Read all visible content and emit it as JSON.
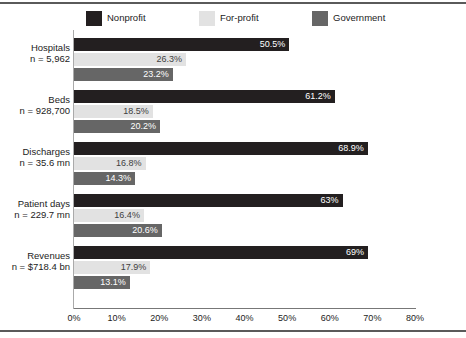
{
  "legend": {
    "items": [
      {
        "label": "Nonprofit",
        "color": "#231f20",
        "left": 0
      },
      {
        "label": "For-profit",
        "color": "#e2e2e2",
        "left": 113
      },
      {
        "label": "Government",
        "color": "#666666",
        "left": 226
      }
    ]
  },
  "axis": {
    "ticks": [
      "0%",
      "10%",
      "20%",
      "30%",
      "40%",
      "50%",
      "60%",
      "70%",
      "80%"
    ]
  },
  "categories": [
    {
      "name": "Hospitals",
      "n": "n = 5,962"
    },
    {
      "name": "Beds",
      "n": "n = 928,700"
    },
    {
      "name": "Discharges",
      "n": "n = 35.6 mn"
    },
    {
      "name": "Patient days",
      "n": "n = 229.7 mn"
    },
    {
      "name": "Revenues",
      "n": "n = $718.4 bn"
    }
  ],
  "chart_data": {
    "type": "bar",
    "orientation": "horizontal",
    "title": "",
    "xlabel": "",
    "ylabel": "",
    "xlim": [
      0,
      80
    ],
    "grid": false,
    "legend_position": "top",
    "categories": [
      "Hospitals",
      "Beds",
      "Discharges",
      "Patient days",
      "Revenues"
    ],
    "category_sublabels": [
      "n = 5,962",
      "n = 928,700",
      "n = 35.6 mn",
      "n = 229.7 mn",
      "n = $718.4 bn"
    ],
    "tick_labels": [
      "0%",
      "10%",
      "20%",
      "30%",
      "40%",
      "50%",
      "60%",
      "70%",
      "80%"
    ],
    "series": [
      {
        "name": "Nonprofit",
        "color": "#231f20",
        "values": [
          50.5,
          61.2,
          68.9,
          63,
          69
        ],
        "labels": [
          "50.5%",
          "61.2%",
          "68.9%",
          "63%",
          "69%"
        ]
      },
      {
        "name": "For-profit",
        "color": "#e2e2e2",
        "values": [
          26.3,
          18.5,
          16.8,
          16.4,
          17.9
        ],
        "labels": [
          "26.3%",
          "18.5%",
          "16.8%",
          "16.4%",
          "17.9%"
        ]
      },
      {
        "name": "Government",
        "color": "#666666",
        "values": [
          23.2,
          20.2,
          14.3,
          20.6,
          13.1
        ],
        "labels": [
          "23.2%",
          "20.2%",
          "14.3%",
          "20.6%",
          "13.1%"
        ]
      }
    ]
  }
}
